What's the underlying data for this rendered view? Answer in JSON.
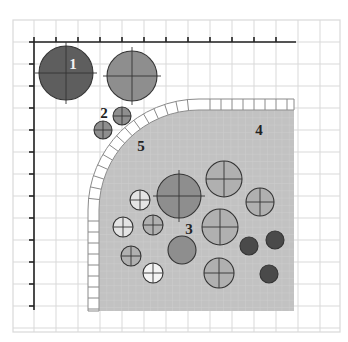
{
  "diagram": {
    "canvas": {
      "width": 348,
      "height": 342
    },
    "colors": {
      "background": "#ffffff",
      "grid": "#d9d9d9",
      "grid_fine": "#e6e6e6",
      "axis": "#222222",
      "region": "#c2c2c2",
      "region_grid": "#d0d0d0",
      "tile_fill": "#ffffff",
      "tile_stroke": "#8a8a8a",
      "circle_dark": "#5e5e5e",
      "circle_mid": "#8e8e8e",
      "circle_light": "#b0b0b0",
      "circle_white": "#f4f4f4",
      "circle_pale": "#e4e4e4",
      "circle_darkest": "#4a4a4a",
      "circle_stroke": "#333333"
    },
    "grid": {
      "x0": 13,
      "y0": 20,
      "x1": 340,
      "y1": 332,
      "step": 22
    },
    "axes": {
      "origin": [
        34,
        42
      ],
      "x_end": 296,
      "y_end": 310,
      "tick_step": 22,
      "tick_len": 5
    },
    "region": {
      "right": 294,
      "bottom": 311,
      "left": 99,
      "top": 110,
      "corner_radius": 100,
      "tile_band": 11
    },
    "labels": [
      {
        "id": "1",
        "text": "1",
        "x": 73,
        "y": 69,
        "white": true
      },
      {
        "id": "2",
        "text": "2",
        "x": 104,
        "y": 118,
        "white": false
      },
      {
        "id": "3",
        "text": "3",
        "x": 189,
        "y": 234,
        "white": false
      },
      {
        "id": "4",
        "text": "4",
        "x": 259,
        "y": 135,
        "white": false
      },
      {
        "id": "5",
        "text": "5",
        "x": 141,
        "y": 151,
        "white": false
      }
    ],
    "circles": [
      {
        "name": "circle-1-large-dark",
        "cx": 66,
        "cy": 73,
        "r": 27,
        "fill": "circle_dark",
        "cross": true
      },
      {
        "name": "circle-large-grey-top",
        "cx": 132,
        "cy": 76,
        "r": 25,
        "fill": "circle_mid",
        "cross": true
      },
      {
        "name": "circle-2a",
        "cx": 122,
        "cy": 116,
        "r": 9,
        "fill": "circle_mid",
        "cross": true
      },
      {
        "name": "circle-2b",
        "cx": 103,
        "cy": 130,
        "r": 9,
        "fill": "circle_mid",
        "cross": true
      },
      {
        "name": "circle-big-center",
        "cx": 179,
        "cy": 196,
        "r": 22,
        "fill": "circle_mid",
        "cross": true
      },
      {
        "name": "circle-upper-right",
        "cx": 224,
        "cy": 179,
        "r": 18,
        "fill": "circle_light",
        "cross": true
      },
      {
        "name": "circle-right",
        "cx": 260,
        "cy": 202,
        "r": 14,
        "fill": "circle_light",
        "cross": true
      },
      {
        "name": "circle-center-right",
        "cx": 220,
        "cy": 227,
        "r": 18,
        "fill": "circle_light",
        "cross": true
      },
      {
        "name": "circle-pale-top",
        "cx": 140,
        "cy": 200,
        "r": 10,
        "fill": "circle_pale",
        "cross": true
      },
      {
        "name": "circle-pale-left",
        "cx": 123,
        "cy": 227,
        "r": 10,
        "fill": "circle_pale",
        "cross": true
      },
      {
        "name": "circle-small-mid",
        "cx": 153,
        "cy": 225,
        "r": 10,
        "fill": "circle_light",
        "cross": true
      },
      {
        "name": "circle-left-bottom",
        "cx": 131,
        "cy": 256,
        "r": 10,
        "fill": "circle_light",
        "cross": true
      },
      {
        "name": "circle-medium-mid",
        "cx": 182,
        "cy": 250,
        "r": 14,
        "fill": "circle_mid",
        "cross": false
      },
      {
        "name": "circle-white-bottom",
        "cx": 153,
        "cy": 273,
        "r": 10,
        "fill": "circle_white",
        "cross": true
      },
      {
        "name": "circle-bottom-right",
        "cx": 219,
        "cy": 273,
        "r": 15,
        "fill": "circle_light",
        "cross": true
      },
      {
        "name": "circle-dark-a",
        "cx": 249,
        "cy": 246,
        "r": 9,
        "fill": "circle_darkest",
        "cross": false
      },
      {
        "name": "circle-dark-b",
        "cx": 275,
        "cy": 240,
        "r": 9,
        "fill": "circle_darkest",
        "cross": false
      },
      {
        "name": "circle-dark-c",
        "cx": 269,
        "cy": 274,
        "r": 9,
        "fill": "circle_darkest",
        "cross": false
      }
    ]
  }
}
